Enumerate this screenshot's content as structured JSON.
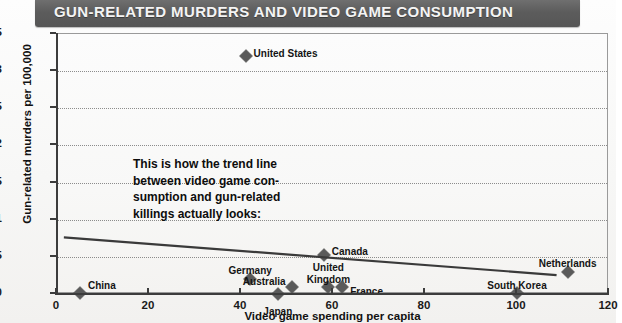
{
  "title": "GUN-RELATED MURDERS AND VIDEO GAME CONSUMPTION",
  "annotation": {
    "line1": "This is how the trend line",
    "line2": "between video game con-",
    "line3": "sumption and gun-related",
    "line4": "killings actually looks:"
  },
  "colors": {
    "banner": "#5c5c5c",
    "marker": "#5a5a5a",
    "trend_line": "#3a3a3a",
    "grid": "#7a7a7a",
    "axis": "#3c3c3c",
    "title_text": "#f4f4f4"
  },
  "chart_data": {
    "type": "scatter",
    "title": "GUN-RELATED MURDERS AND VIDEO GAME CONSUMPTION",
    "xlabel": "Video game spending per capita",
    "ylabel": "Gun-related murders per 100,000",
    "xlim": [
      0,
      120
    ],
    "ylim": [
      0,
      3.5
    ],
    "xticks": [
      0,
      20,
      40,
      60,
      80,
      100,
      120
    ],
    "yticks": [
      0,
      0.5,
      1,
      1.5,
      2,
      2.5,
      3,
      3.5
    ],
    "xtick_labels": [
      "0",
      "20",
      "40",
      "60",
      "80",
      "100",
      "120"
    ],
    "ytick_labels": [
      "0",
      "0.5",
      "1",
      "1.5",
      "2",
      "2.5",
      "3",
      "3.5"
    ],
    "grid": "horizontal-dotted",
    "legend": "none",
    "points": [
      {
        "label": "China",
        "x": 5,
        "y": 0.02,
        "label_dx": 8,
        "label_dy": -13,
        "label_align": "left"
      },
      {
        "label": "Germany",
        "x": 42,
        "y": 0.2,
        "label_dx": 0,
        "label_dy": -14,
        "label_align": "center"
      },
      {
        "label": "Japan",
        "x": 48,
        "y": 0.0,
        "label_dx": 0,
        "label_dy": 12,
        "label_align": "center"
      },
      {
        "label": "Australia",
        "x": 51,
        "y": 0.1,
        "label_dx": -6,
        "label_dy": -11,
        "label_align": "right"
      },
      {
        "label": "United",
        "x": 59,
        "y": 0.1,
        "label_dx": 0,
        "label_dy": -25,
        "label_align": "center"
      },
      {
        "label": "Kingdom",
        "x": 59,
        "y": 0.1,
        "label_dx": 0,
        "label_dy": -13,
        "label_align": "center"
      },
      {
        "label": "France",
        "x": 62,
        "y": 0.1,
        "label_dx": 8,
        "label_dy": -1,
        "label_align": "left"
      },
      {
        "label": "Canada",
        "x": 58,
        "y": 0.52,
        "label_dx": 8,
        "label_dy": -9,
        "label_align": "left"
      },
      {
        "label": "United States",
        "x": 41,
        "y": 3.2,
        "label_dx": 8,
        "label_dy": -8,
        "label_align": "left"
      },
      {
        "label": "South Korea",
        "x": 100,
        "y": 0.02,
        "label_dx": 0,
        "label_dy": -13,
        "label_align": "center"
      },
      {
        "label": "Netherlands",
        "x": 111,
        "y": 0.3,
        "label_dx": 0,
        "label_dy": -14,
        "label_align": "center"
      }
    ],
    "trend_line": {
      "x0": 1.5,
      "y0": 0.74,
      "x1": 109,
      "y1": 0.23,
      "note": "downward sloping least-squares fit"
    }
  }
}
